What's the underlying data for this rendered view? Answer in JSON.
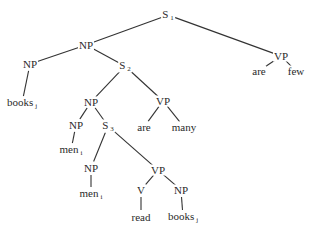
{
  "diagram": {
    "type": "syntax-tree",
    "nodes": [
      {
        "id": "s1",
        "label": "S",
        "sub": "1",
        "x": 168,
        "y": 15
      },
      {
        "id": "np_top",
        "label": "NP",
        "sub": "",
        "x": 86,
        "y": 45
      },
      {
        "id": "vp_right",
        "label": "VP",
        "sub": "",
        "x": 281,
        "y": 56
      },
      {
        "id": "are_right",
        "label": "are",
        "sub": "",
        "x": 259,
        "y": 71
      },
      {
        "id": "few",
        "label": "few",
        "sub": "",
        "x": 296,
        "y": 71
      },
      {
        "id": "np_left",
        "label": "NP",
        "sub": "",
        "x": 30,
        "y": 64
      },
      {
        "id": "s2",
        "label": "S",
        "sub": "2",
        "x": 125,
        "y": 66
      },
      {
        "id": "books_j_left",
        "label": "books",
        "sub": "j",
        "x": 22,
        "y": 103
      },
      {
        "id": "np_mid",
        "label": "NP",
        "sub": "",
        "x": 91,
        "y": 102
      },
      {
        "id": "vp_mid",
        "label": "VP",
        "sub": "",
        "x": 163,
        "y": 101
      },
      {
        "id": "are_mid",
        "label": "are",
        "sub": "",
        "x": 144,
        "y": 127
      },
      {
        "id": "many",
        "label": "many",
        "sub": "",
        "x": 184,
        "y": 127
      },
      {
        "id": "np_men",
        "label": "NP",
        "sub": "",
        "x": 76,
        "y": 125
      },
      {
        "id": "s3",
        "label": "S",
        "sub": "3",
        "x": 108,
        "y": 126
      },
      {
        "id": "men_i_1",
        "label": "men",
        "sub": "i",
        "x": 71,
        "y": 150
      },
      {
        "id": "np_inner",
        "label": "NP",
        "sub": "",
        "x": 91,
        "y": 168
      },
      {
        "id": "men_i_2",
        "label": "men",
        "sub": "i",
        "x": 91,
        "y": 194
      },
      {
        "id": "vp_inner",
        "label": "VP",
        "sub": "",
        "x": 158,
        "y": 170
      },
      {
        "id": "v",
        "label": "V",
        "sub": "",
        "x": 141,
        "y": 190
      },
      {
        "id": "np_obj",
        "label": "NP",
        "sub": "",
        "x": 181,
        "y": 190
      },
      {
        "id": "read",
        "label": "read",
        "sub": "",
        "x": 141,
        "y": 217
      },
      {
        "id": "books_j_obj",
        "label": "books",
        "sub": "j",
        "x": 183,
        "y": 217
      }
    ],
    "edges": [
      [
        "s1",
        "np_top"
      ],
      [
        "s1",
        "vp_right"
      ],
      [
        "vp_right",
        "are_right"
      ],
      [
        "vp_right",
        "few"
      ],
      [
        "np_top",
        "np_left"
      ],
      [
        "np_top",
        "s2"
      ],
      [
        "np_left",
        "books_j_left"
      ],
      [
        "s2",
        "np_mid"
      ],
      [
        "s2",
        "vp_mid"
      ],
      [
        "vp_mid",
        "are_mid"
      ],
      [
        "vp_mid",
        "many"
      ],
      [
        "np_mid",
        "np_men"
      ],
      [
        "np_mid",
        "s3"
      ],
      [
        "np_men",
        "men_i_1"
      ],
      [
        "s3",
        "np_inner"
      ],
      [
        "s3",
        "vp_inner"
      ],
      [
        "np_inner",
        "men_i_2"
      ],
      [
        "vp_inner",
        "v"
      ],
      [
        "vp_inner",
        "np_obj"
      ],
      [
        "v",
        "read"
      ],
      [
        "np_obj",
        "books_j_obj"
      ]
    ]
  }
}
